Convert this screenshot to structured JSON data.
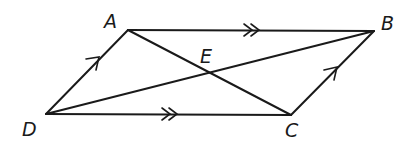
{
  "figure": {
    "type": "parallelogram-with-diagonals",
    "stroke_color": "#1a1a1a",
    "background": "#ffffff"
  },
  "points": {
    "A": {
      "label": "A",
      "x": 128,
      "y": 30
    },
    "B": {
      "label": "B",
      "x": 374,
      "y": 31
    },
    "C": {
      "label": "C",
      "x": 291,
      "y": 115
    },
    "D": {
      "label": "D",
      "x": 46,
      "y": 114
    },
    "E": {
      "label": "E",
      "x": 208,
      "y": 72
    }
  },
  "segments": [
    {
      "from": "A",
      "to": "B",
      "marker": "double-arrow"
    },
    {
      "from": "D",
      "to": "C",
      "marker": "double-arrow"
    },
    {
      "from": "D",
      "to": "A",
      "marker": "single-arrow"
    },
    {
      "from": "C",
      "to": "B",
      "marker": "single-arrow"
    },
    {
      "from": "A",
      "to": "C",
      "marker": "none"
    },
    {
      "from": "D",
      "to": "B",
      "marker": "none"
    }
  ],
  "labels": {
    "A": "A",
    "B": "B",
    "C": "C",
    "D": "D",
    "E": "E"
  }
}
